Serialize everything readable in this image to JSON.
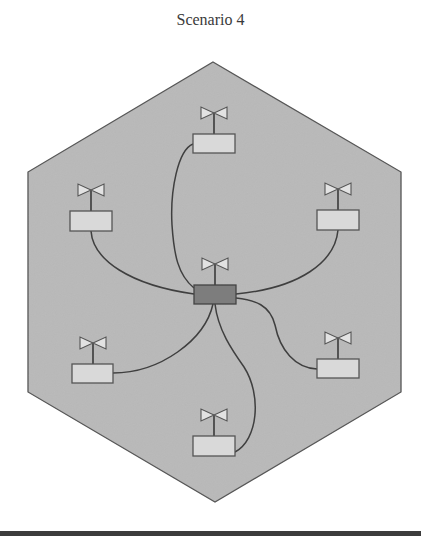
{
  "title": "Scenario 4",
  "colors": {
    "cell_fill": "#b9b9b9",
    "cell_stroke": "#555555",
    "node_fill": "#d9d9d9",
    "hub_fill": "#7d7d7d",
    "link_stroke": "#3f3f3f",
    "antenna_fill": "#e2e2e2"
  },
  "cell": {
    "shape": "hexagon",
    "vertices": [
      [
        213,
        62
      ],
      [
        401,
        172
      ],
      [
        401,
        392
      ],
      [
        215,
        502
      ],
      [
        28,
        392
      ],
      [
        28,
        172
      ]
    ]
  },
  "hub": {
    "name": "central-node",
    "cx": 215,
    "box_y": 285,
    "w": 42,
    "h": 19
  },
  "nodes": [
    {
      "name": "node-top",
      "cx": 214,
      "box_y": 134
    },
    {
      "name": "node-upper-left",
      "cx": 91,
      "box_y": 211
    },
    {
      "name": "node-upper-right",
      "cx": 338,
      "box_y": 210
    },
    {
      "name": "node-lower-left",
      "cx": 93,
      "box_y": 364
    },
    {
      "name": "node-lower-right",
      "cx": 338,
      "box_y": 359
    },
    {
      "name": "node-bottom",
      "cx": 214,
      "box_y": 436
    }
  ]
}
